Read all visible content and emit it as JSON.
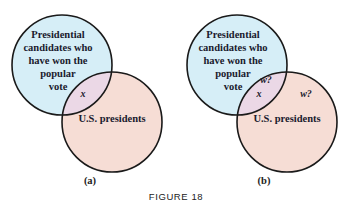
{
  "figure": {
    "caption": "FIGURE 18",
    "panels": [
      {
        "label": "(a)",
        "set_a": {
          "lines": [
            "Presidential",
            "candidates who",
            "have won the",
            "popular",
            "vote"
          ],
          "color": "#d6eef7"
        },
        "set_b": {
          "label": "U.S. presidents",
          "color": "#f6ddd5"
        },
        "intersection": {
          "labels": [
            "x"
          ],
          "color": "#ebd8e6"
        }
      },
      {
        "label": "(b)",
        "set_a": {
          "lines": [
            "Presidential",
            "candidates who",
            "have won the",
            "popular",
            "vote"
          ],
          "color": "#d6eef7"
        },
        "set_b": {
          "label": "U.S. presidents",
          "extra_label": "w?",
          "color": "#f6ddd5"
        },
        "intersection": {
          "labels": [
            "w?",
            "x"
          ],
          "color": "#ebd8e6"
        }
      }
    ]
  },
  "colors": {
    "outline": "#1a1a1a",
    "set_a_fill": "#d6eef7",
    "set_b_fill": "#f6ddd5",
    "overlap_fill": "#ebd8e6"
  }
}
